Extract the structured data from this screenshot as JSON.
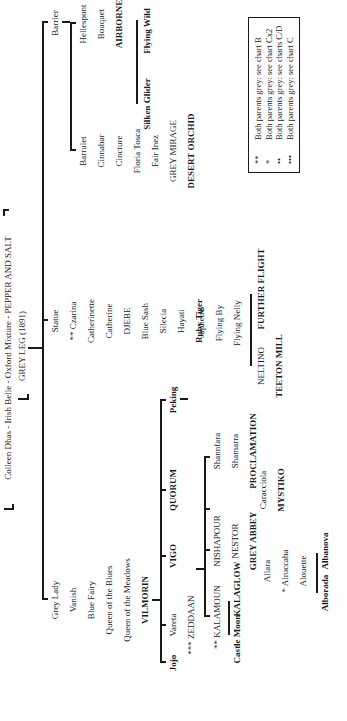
{
  "header": {
    "ancestry": "Colleen Dhas - Irish Belle - Oxford Mixture - PEPPER AND SALT",
    "founder": "GREY LEG (1891)"
  },
  "branches": {
    "barrier": {
      "name": "Barrier",
      "left_line": [
        "Barrulet",
        "Cinnabar",
        "Cincture",
        "Floria Tosca",
        "Fair Inez",
        "GREY MIRAGE",
        "DESERT ORCHID"
      ],
      "right_line": [
        "Hellespont",
        "Bouquet",
        "AIRBORNE"
      ],
      "airborne_offspring": [
        "Silken Glider",
        "Flying Wild"
      ]
    },
    "statue": {
      "name": "Statue",
      "line": [
        "** Czarina",
        "Catherinette",
        "Catherine",
        "DJEBE",
        "Blue Sash",
        "Silecia",
        "Hayati",
        "Ruby Tiger"
      ]
    },
    "grey_lady": {
      "name": "Grey Lady",
      "line": [
        "Vanish",
        "Blue Fairy",
        "Queen of the Blues",
        "Queen of the Meadows",
        "VILMORIN"
      ],
      "vilmorin_offspring": [
        "Jojo",
        "Vareta",
        "VIGO",
        "QUORUM",
        "Peking"
      ],
      "vareta_line": [
        "*** ZEDDAAN"
      ],
      "zeddaan_offspring": {
        "kalamoun": {
          "name": "** KALAMOUN",
          "offspring": [
            "Castle Moon",
            "KALAGLOW"
          ]
        },
        "allara": {
          "name": "Allara",
          "line": [
            "* Alruccaba",
            "Alouette"
          ],
          "offspring": [
            "Alborada",
            "Albanova"
          ]
        },
        "nishapour": {
          "name": "NISHAPOUR",
          "line": [
            "NESTOR",
            "GREY ABBEY"
          ]
        },
        "caracciola": {
          "name": "Caracciola",
          "line": [
            "MYSTIKO"
          ]
        },
        "shannfara": {
          "name": "Shannfara",
          "line": [
            "Shamarra",
            "PROCLAMATION"
          ]
        }
      },
      "peking_line": [
        "Japhette",
        "Flying By",
        "Flying Nelly"
      ],
      "flying_nelly_offspring": {
        "neltino": {
          "name": "NELTINO",
          "line": [
            "TEETON MILL"
          ]
        },
        "further_flight": "FURTHER FLIGHT"
      }
    }
  },
  "legend": [
    {
      "symbol": "**",
      "text": "Both parents grey: see chart B"
    },
    {
      "symbol": "*",
      "text": "Both parents grey: see chart Cx2"
    },
    {
      "symbol": "••",
      "text": "Both parents grey: see charts C/D"
    },
    {
      "symbol": "•••",
      "text": "Both parents grey: see chart C"
    }
  ]
}
